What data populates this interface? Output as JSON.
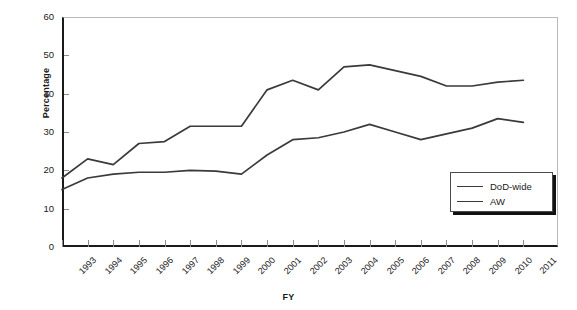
{
  "chart_data": {
    "type": "line",
    "title": "",
    "xlabel": "FY",
    "ylabel": "Percentage",
    "ylim": [
      0,
      60
    ],
    "yticks": [
      0,
      10,
      20,
      30,
      40,
      50,
      60
    ],
    "grid": false,
    "legend_position": "bottom-right",
    "categories": [
      "1993",
      "1994",
      "1995",
      "1996",
      "1997",
      "1998",
      "1999",
      "2000",
      "2001",
      "2002",
      "2003",
      "2004",
      "2005",
      "2006",
      "2007",
      "2008",
      "2009",
      "2010",
      "2011"
    ],
    "series": [
      {
        "name": "DoD-wide",
        "color": "#3a3a3a",
        "values": [
          18,
          23,
          21.5,
          27,
          27.5,
          31.5,
          31.5,
          31.5,
          41,
          43.5,
          41,
          47,
          47.5,
          46,
          44.5,
          42,
          42,
          43,
          43.5
        ]
      },
      {
        "name": "AW",
        "color": "#3a3a3a",
        "values": [
          15,
          18,
          19,
          19.5,
          19.5,
          20,
          19.8,
          19,
          24,
          28,
          28.5,
          30,
          32,
          30,
          28,
          29.5,
          31,
          33.5,
          32.5
        ]
      }
    ]
  },
  "legend": {
    "items": [
      {
        "label": "DoD-wide"
      },
      {
        "label": "AW"
      }
    ]
  }
}
